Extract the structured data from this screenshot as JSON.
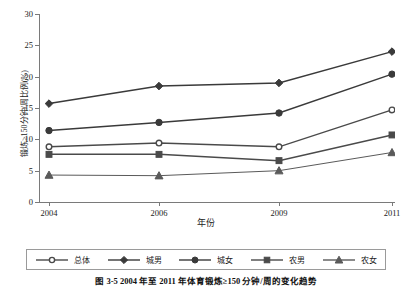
{
  "figure": {
    "caption": "图 3-5  2004 年至 2011 年体育锻炼≥150 分钟/周的变化趋势",
    "ylabel": "锻炼≥150分钟/周比例(%)",
    "xlabel": "年份"
  },
  "axes": {
    "yticks": [
      0,
      5,
      10,
      15,
      20,
      25,
      30
    ],
    "ytick_labels": [
      "0",
      "5",
      "10",
      "15",
      "20",
      "25",
      "30"
    ],
    "xtick_labels": [
      "2004",
      "2006",
      "2009",
      "2011"
    ],
    "ylim": [
      0,
      30
    ],
    "grid": false
  },
  "legend": {
    "position": "bottom",
    "entries": [
      {
        "label": "总体",
        "marker": "open-circle",
        "color": "#4a4a4a"
      },
      {
        "label": "城男",
        "marker": "filled-diamond",
        "color": "#3a3a3a"
      },
      {
        "label": "城女",
        "marker": "filled-circle",
        "color": "#3a3a3a"
      },
      {
        "label": "农男",
        "marker": "filled-square",
        "color": "#4a4a4a"
      },
      {
        "label": "农女",
        "marker": "filled-triangle",
        "color": "#5a5a5a"
      }
    ]
  },
  "chart_data": {
    "type": "line",
    "title": "图 3-5  2004 年至 2011 年体育锻炼≥150 分钟/周的变化趋势",
    "xlabel": "年份",
    "ylabel": "锻炼≥150分钟/周比例(%)",
    "categories": [
      "2004",
      "2006",
      "2009",
      "2011"
    ],
    "ylim": [
      0,
      30
    ],
    "grid": false,
    "legend_position": "bottom",
    "series": [
      {
        "name": "总体",
        "marker": "open-circle",
        "values": [
          8.8,
          9.4,
          8.8,
          14.7
        ]
      },
      {
        "name": "城男",
        "marker": "filled-diamond",
        "values": [
          15.7,
          18.5,
          19.0,
          24.0
        ]
      },
      {
        "name": "城女",
        "marker": "filled-circle",
        "values": [
          11.4,
          12.7,
          14.2,
          20.4
        ]
      },
      {
        "name": "农男",
        "marker": "filled-square",
        "values": [
          7.6,
          7.6,
          6.6,
          10.7
        ]
      },
      {
        "name": "农女",
        "marker": "filled-triangle",
        "values": [
          4.3,
          4.2,
          5.0,
          7.9
        ]
      }
    ]
  }
}
